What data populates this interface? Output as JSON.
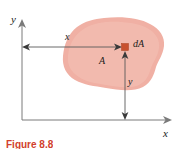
{
  "figure": {
    "kind": "engineering-mechanics-diagram",
    "caption": "Figure 8.8",
    "colors": {
      "area_fill": "#f0b0a4",
      "area_fill_light": "#f3bdb2",
      "element_square": "#c8512f",
      "axis_line": "#7a7a7a",
      "dimension_line": "#5a5a5a",
      "label_text": "#1a1a1a",
      "caption_text": "#d1402c",
      "background": "#ffffff"
    },
    "axes": {
      "y_axis_label": "y",
      "x_axis_label": "x",
      "origin_px": [
        22,
        120
      ],
      "y_axis_top_px": [
        22,
        21
      ],
      "x_axis_right_px": [
        172,
        120
      ]
    },
    "labels": {
      "area": "A",
      "element": "dA",
      "dim_x": "x",
      "dim_y": "y"
    },
    "element": {
      "name": "dA",
      "center_px": [
        125,
        47
      ],
      "size_px": 7
    },
    "dimensions": [
      {
        "name": "x",
        "from_px": [
          23,
          47
        ],
        "to_px": [
          121,
          47
        ],
        "label": "x",
        "orientation": "horizontal"
      },
      {
        "name": "y",
        "from_px": [
          125,
          118
        ],
        "to_px": [
          125,
          52
        ],
        "label": "y",
        "orientation": "vertical"
      }
    ],
    "area_region": {
      "label": "A",
      "bounds_px": {
        "left": 64,
        "top": 18,
        "right": 164,
        "bottom": 90
      }
    }
  }
}
